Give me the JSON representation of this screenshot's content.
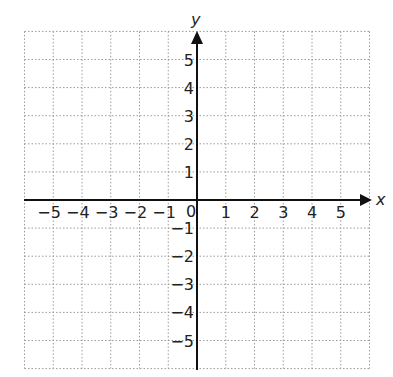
{
  "chart_data": {
    "type": "coordinate_grid",
    "title": "",
    "xlabel": "x",
    "ylabel": "y",
    "xlim": [
      -6,
      6
    ],
    "ylim": [
      -6,
      6
    ],
    "grid": true,
    "grid_style": "dotted",
    "x_ticks": [
      "-5",
      "-4",
      "-3",
      "-2",
      "-1",
      "1",
      "2",
      "3",
      "4",
      "5"
    ],
    "y_ticks": [
      "5",
      "4",
      "3",
      "2",
      "1",
      "-1",
      "-2",
      "-3",
      "-4",
      "-5"
    ],
    "origin_label": "0",
    "points": []
  },
  "colors": {
    "axis": "#111111",
    "grid": "#9a9a9a",
    "text": "#222222",
    "background": "#ffffff"
  }
}
